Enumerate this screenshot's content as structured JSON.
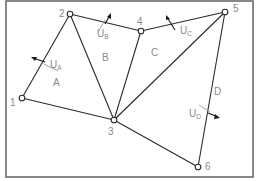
{
  "diagram": {
    "title": "",
    "nodes": [
      {
        "id": "1",
        "label": "1",
        "x": 22,
        "y": 98,
        "lx": 10,
        "ly": 105
      },
      {
        "id": "2",
        "label": "2",
        "x": 70,
        "y": 14,
        "lx": 59,
        "ly": 16
      },
      {
        "id": "3",
        "label": "3",
        "x": 114,
        "y": 120,
        "lx": 108,
        "ly": 134
      },
      {
        "id": "4",
        "label": "4",
        "x": 141,
        "y": 31,
        "lx": 136,
        "ly": 24
      },
      {
        "id": "5",
        "label": "5",
        "x": 225,
        "y": 12,
        "lx": 233,
        "ly": 11
      },
      {
        "id": "6",
        "label": "6",
        "x": 198,
        "y": 167,
        "lx": 205,
        "ly": 168
      }
    ],
    "edges": [
      [
        "1",
        "2"
      ],
      [
        "1",
        "3"
      ],
      [
        "2",
        "3"
      ],
      [
        "2",
        "4"
      ],
      [
        "3",
        "4"
      ],
      [
        "4",
        "5"
      ],
      [
        "3",
        "5"
      ],
      [
        "5",
        "6"
      ],
      [
        "3",
        "6"
      ]
    ],
    "regions": [
      {
        "label": "A",
        "x": 53,
        "y": 86
      },
      {
        "label": "B",
        "x": 102,
        "y": 61
      },
      {
        "label": "C",
        "x": 151,
        "y": 56
      },
      {
        "label": "D",
        "x": 214,
        "y": 95
      }
    ],
    "velocities": [
      {
        "main": "U",
        "sub": "A",
        "tx": 50,
        "ty": 68
      },
      {
        "main": "U",
        "sub": "B",
        "tx": 97,
        "ty": 37
      },
      {
        "main": "U",
        "sub": "C",
        "tx": 180,
        "ty": 34
      },
      {
        "main": "U",
        "sub": "D",
        "tx": 189,
        "ty": 117
      }
    ]
  }
}
